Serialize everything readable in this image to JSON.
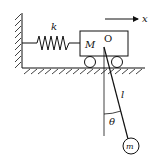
{
  "diagram": {
    "labels": {
      "spring_constant": "k",
      "cart_mass": "M",
      "pivot": "O",
      "axis": "x",
      "length": "l",
      "angle": "θ",
      "bob_mass": "m"
    },
    "colors": {
      "stroke": "#111111",
      "background": "#ffffff"
    }
  }
}
